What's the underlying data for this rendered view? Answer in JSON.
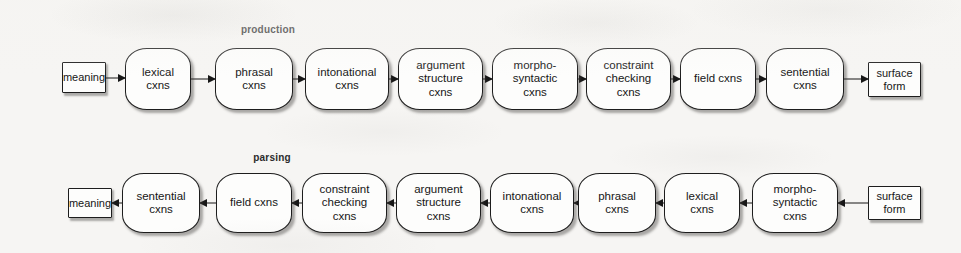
{
  "figure": {
    "background_color": "#f6f5f3",
    "ink_color": "#171717",
    "node_fill": "#fdfdfc"
  },
  "rows": [
    {
      "id": "production",
      "label": "production",
      "direction": "left-to-right",
      "nodes": [
        {
          "id": "meaning",
          "kind": "terminal",
          "lines": [
            "meaning"
          ]
        },
        {
          "id": "lexical",
          "kind": "stage",
          "lines": [
            "lexical",
            "cxns"
          ]
        },
        {
          "id": "phrasal",
          "kind": "stage",
          "lines": [
            "phrasal",
            "cxns"
          ]
        },
        {
          "id": "intonational",
          "kind": "stage",
          "lines": [
            "intonational",
            "cxns"
          ]
        },
        {
          "id": "argument-structure",
          "kind": "stage",
          "lines": [
            "argument",
            "structure",
            "cxns"
          ]
        },
        {
          "id": "morpho-syntactic",
          "kind": "stage",
          "lines": [
            "morpho-",
            "syntactic",
            "cxns"
          ]
        },
        {
          "id": "constraint-checking",
          "kind": "stage",
          "lines": [
            "constraint",
            "checking",
            "cxns"
          ]
        },
        {
          "id": "field",
          "kind": "stage",
          "lines": [
            "field cxns"
          ]
        },
        {
          "id": "sentential",
          "kind": "stage",
          "lines": [
            "sentential",
            "cxns"
          ]
        },
        {
          "id": "surface-form",
          "kind": "terminal",
          "lines": [
            "surface",
            "form"
          ]
        }
      ]
    },
    {
      "id": "parsing",
      "label": "parsing",
      "direction": "right-to-left",
      "nodes": [
        {
          "id": "meaning",
          "kind": "terminal",
          "lines": [
            "meaning"
          ]
        },
        {
          "id": "sentential",
          "kind": "stage",
          "lines": [
            "sentential",
            "cxns"
          ]
        },
        {
          "id": "field",
          "kind": "stage",
          "lines": [
            "field cxns"
          ]
        },
        {
          "id": "constraint-checking",
          "kind": "stage",
          "lines": [
            "constraint",
            "checking",
            "cxns"
          ]
        },
        {
          "id": "argument-structure",
          "kind": "stage",
          "lines": [
            "argument",
            "structure",
            "cxns"
          ]
        },
        {
          "id": "intonational",
          "kind": "stage",
          "lines": [
            "intonational",
            "cxns"
          ]
        },
        {
          "id": "phrasal",
          "kind": "stage",
          "lines": [
            "phrasal",
            "cxns"
          ]
        },
        {
          "id": "lexical",
          "kind": "stage",
          "lines": [
            "lexical",
            "cxns"
          ]
        },
        {
          "id": "morpho-syntactic",
          "kind": "stage",
          "lines": [
            "morpho-",
            "syntactic",
            "cxns"
          ]
        },
        {
          "id": "surface-form",
          "kind": "terminal",
          "lines": [
            "surface",
            "form"
          ]
        }
      ]
    }
  ],
  "geometry": {
    "production": {
      "label_x": 268,
      "label_y": 24,
      "box_top": 48,
      "box_height": 62,
      "terminal_top": 62,
      "terminal_height": 31,
      "terminal_top_2line": 62,
      "terminal_height_2line": 35,
      "x": [
        62,
        125,
        215,
        305,
        398,
        492,
        586,
        680,
        766,
        868
      ],
      "w": [
        44,
        66,
        78,
        84,
        85,
        86,
        85,
        76,
        78,
        53
      ]
    },
    "parsing": {
      "label_x": 272,
      "label_y": 152,
      "box_top": 173,
      "box_height": 60,
      "terminal_top": 188,
      "terminal_height": 30,
      "terminal_top_2line": 186,
      "terminal_height_2line": 34,
      "x": [
        68,
        122,
        216,
        302,
        396,
        490,
        578,
        664,
        752,
        868
      ],
      "w": [
        44,
        78,
        76,
        85,
        85,
        84,
        78,
        76,
        86,
        53
      ]
    }
  }
}
